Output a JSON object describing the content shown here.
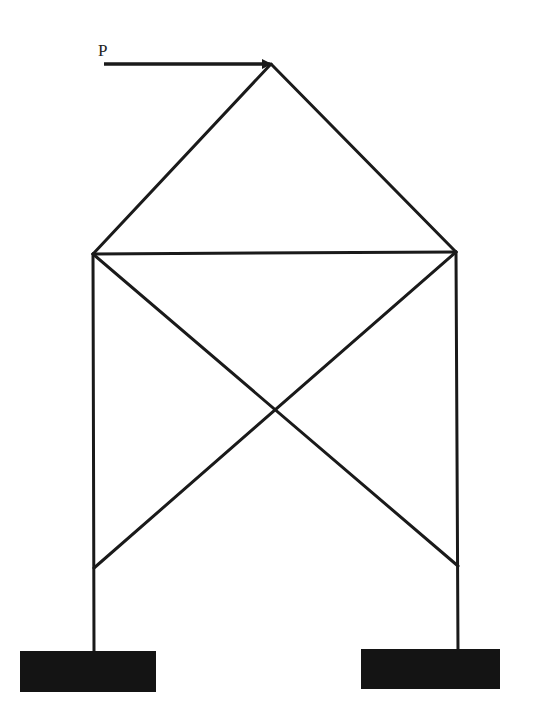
{
  "diagram": {
    "type": "truss-frame",
    "load": {
      "label": "P",
      "direction": "horizontal-right",
      "applied_at": "apex"
    },
    "nodes": {
      "apex": [
        271,
        64
      ],
      "top_left": [
        93,
        254
      ],
      "top_right": [
        456,
        252
      ],
      "low_left": [
        94,
        568
      ],
      "low_right": [
        458,
        566
      ],
      "base_left": [
        94,
        652
      ],
      "base_right": [
        458,
        650
      ]
    },
    "members": [
      [
        "apex",
        "top_left"
      ],
      [
        "apex",
        "top_right"
      ],
      [
        "top_left",
        "top_right"
      ],
      [
        "top_left",
        "low_right"
      ],
      [
        "top_right",
        "low_left"
      ],
      [
        "top_left",
        "base_left"
      ],
      [
        "top_right",
        "base_right"
      ]
    ],
    "supports": [
      {
        "name": "left-footing",
        "x": 20,
        "y": 651,
        "w": 136,
        "h": 41
      },
      {
        "name": "right-footing",
        "x": 361,
        "y": 649,
        "w": 139,
        "h": 40
      }
    ],
    "colors": {
      "line": "#1a1a1a",
      "footing": "#141414"
    }
  }
}
